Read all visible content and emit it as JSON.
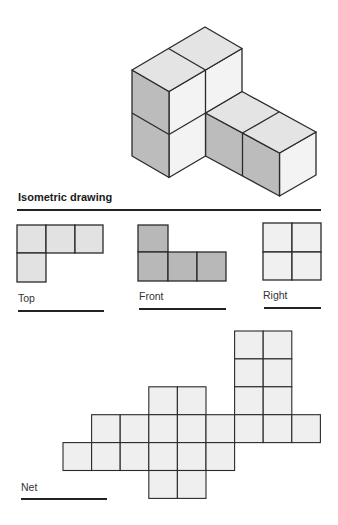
{
  "heading": "Isometric drawing",
  "views": {
    "top": {
      "label": "Top"
    },
    "front": {
      "label": "Front"
    },
    "right": {
      "label": "Right"
    },
    "net": {
      "label": "Net"
    }
  },
  "colors": {
    "top_face": "#e4e4e4",
    "left_face": "#bcbcbc",
    "right_face": "#f3f3f3",
    "top_view_fill": "#e2e2e2",
    "front_view_fill": "#b8b8b8",
    "right_view_fill": "#f0f0f0",
    "net_fill": "#efefef",
    "stroke": "#2a2a2a"
  },
  "isometric_shape": {
    "description": "L-shaped solid of 6 unit cubes: a 2x2 tower (1 wide, 2 deep, 2 tall) with a 2-cube arm extending from the back column at ground level",
    "cube_count": 6
  },
  "top_view_grid": [
    [
      1,
      1,
      1
    ],
    [
      1,
      0,
      0
    ]
  ],
  "front_view_grid": [
    [
      1,
      0,
      0
    ],
    [
      1,
      1,
      1
    ]
  ],
  "right_view_grid": [
    [
      1,
      1
    ],
    [
      1,
      1
    ]
  ],
  "net_cells": [
    [
      6,
      0
    ],
    [
      7,
      0
    ],
    [
      6,
      1
    ],
    [
      7,
      1
    ],
    [
      6,
      2
    ],
    [
      7,
      2
    ],
    [
      3,
      2
    ],
    [
      4,
      2
    ],
    [
      1,
      3
    ],
    [
      2,
      3
    ],
    [
      3,
      3
    ],
    [
      4,
      3
    ],
    [
      5,
      3
    ],
    [
      6,
      3
    ],
    [
      7,
      3
    ],
    [
      8,
      3
    ],
    [
      0,
      4
    ],
    [
      1,
      4
    ],
    [
      2,
      4
    ],
    [
      3,
      4
    ],
    [
      4,
      4
    ],
    [
      5,
      4
    ],
    [
      3,
      5
    ],
    [
      4,
      5
    ]
  ]
}
